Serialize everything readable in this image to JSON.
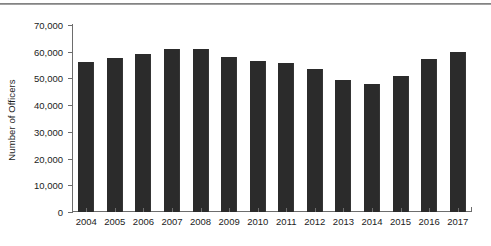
{
  "chart_data": {
    "type": "bar",
    "title": "",
    "subtitle": "",
    "xlabel": "",
    "ylabel": "Number of Officers",
    "categories": [
      "2004",
      "2005",
      "2006",
      "2007",
      "2008",
      "2009",
      "2010",
      "2011",
      "2012",
      "2013",
      "2014",
      "2015",
      "2016",
      "2017"
    ],
    "values": [
      56200,
      57700,
      59100,
      61100,
      61000,
      58200,
      56500,
      55800,
      53700,
      49500,
      47900,
      51000,
      57300,
      59900
    ],
    "ylim": [
      0,
      70000
    ],
    "ytick_values": [
      0,
      10000,
      20000,
      30000,
      40000,
      50000,
      60000,
      70000
    ],
    "ytick_labels": [
      "0",
      "10,000",
      "20,000",
      "30,000",
      "40,000",
      "50,000",
      "60,000",
      "70,000"
    ],
    "grid": false,
    "legend": null,
    "legend_position": "none",
    "bar_color": "#2b2b2b",
    "axis_color": "#6d6d6d",
    "background_color": "#ffffff",
    "annotations": []
  }
}
